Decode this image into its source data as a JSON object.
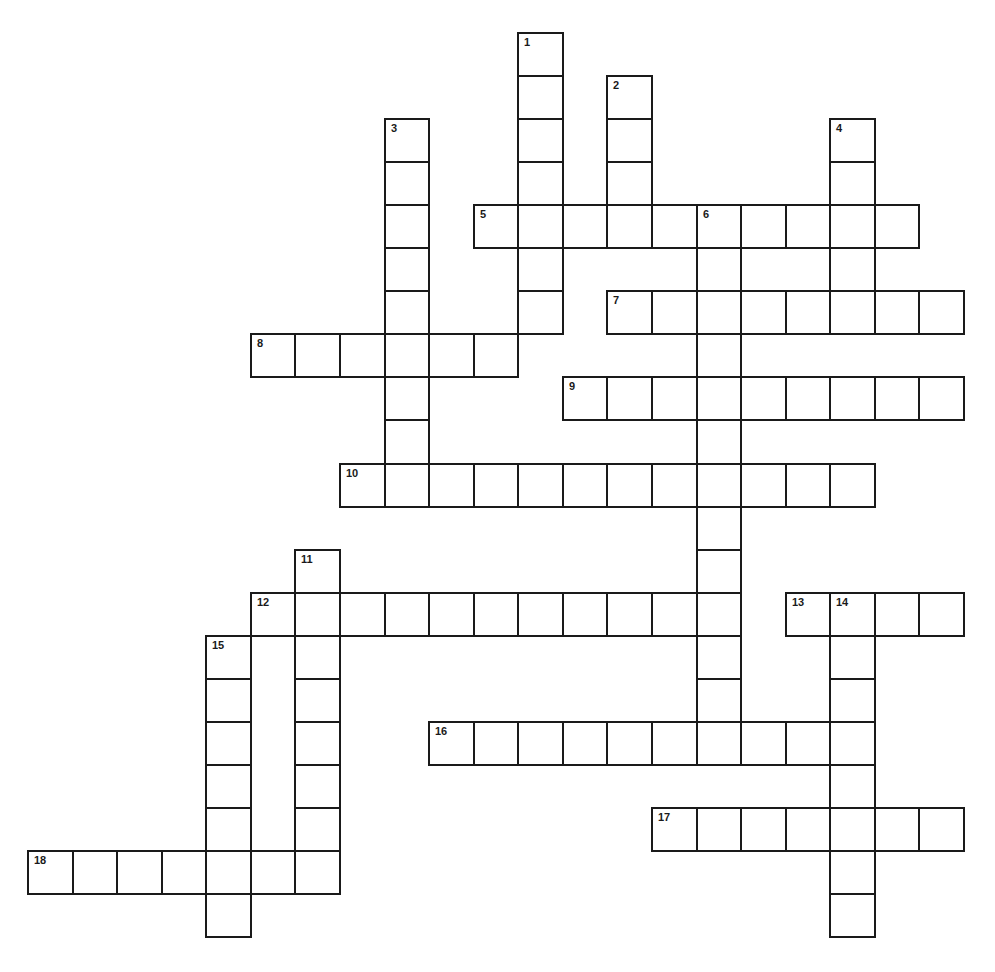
{
  "puzzle": {
    "layout": {
      "origin_x": 27,
      "origin_y": 32,
      "cell_w": 44.57,
      "cell_h": 43.05,
      "line_color": "#1a1a1a",
      "fill_color": "#ffffff"
    },
    "words": [
      {
        "number": 1,
        "direction": "down",
        "row": 0,
        "col": 11,
        "length": 7
      },
      {
        "number": 2,
        "direction": "down",
        "row": 1,
        "col": 13,
        "length": 4
      },
      {
        "number": 3,
        "direction": "down",
        "row": 2,
        "col": 8,
        "length": 9
      },
      {
        "number": 4,
        "direction": "down",
        "row": 2,
        "col": 18,
        "length": 5
      },
      {
        "number": 5,
        "direction": "across",
        "row": 4,
        "col": 10,
        "length": 10
      },
      {
        "number": 6,
        "direction": "down",
        "row": 4,
        "col": 15,
        "length": 13
      },
      {
        "number": 7,
        "direction": "across",
        "row": 6,
        "col": 13,
        "length": 8
      },
      {
        "number": 8,
        "direction": "across",
        "row": 7,
        "col": 5,
        "length": 6
      },
      {
        "number": 9,
        "direction": "across",
        "row": 8,
        "col": 12,
        "length": 9
      },
      {
        "number": 10,
        "direction": "across",
        "row": 10,
        "col": 7,
        "length": 12
      },
      {
        "number": 11,
        "direction": "down",
        "row": 12,
        "col": 6,
        "length": 8
      },
      {
        "number": 12,
        "direction": "across",
        "row": 13,
        "col": 5,
        "length": 11
      },
      {
        "number": 13,
        "direction": "across",
        "row": 13,
        "col": 17,
        "length": 4
      },
      {
        "number": 14,
        "direction": "down",
        "row": 13,
        "col": 18,
        "length": 8
      },
      {
        "number": 15,
        "direction": "down",
        "row": 14,
        "col": 4,
        "length": 7
      },
      {
        "number": 16,
        "direction": "across",
        "row": 16,
        "col": 9,
        "length": 10
      },
      {
        "number": 17,
        "direction": "across",
        "row": 18,
        "col": 14,
        "length": 7
      },
      {
        "number": 18,
        "direction": "across",
        "row": 19,
        "col": 0,
        "length": 7
      }
    ]
  }
}
